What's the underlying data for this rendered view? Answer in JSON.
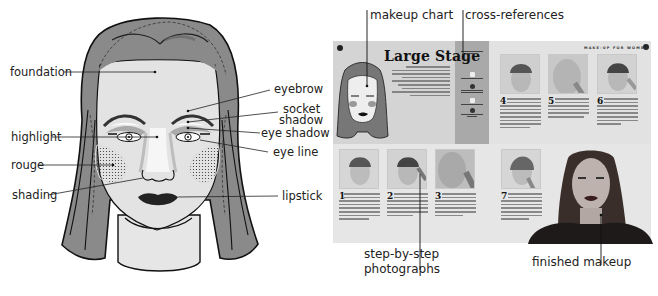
{
  "left_chart": {
    "labels_left": [
      {
        "id": "foundation",
        "text": "foundation"
      },
      {
        "id": "highlight",
        "text": "highlight"
      },
      {
        "id": "rouge",
        "text": "rouge"
      },
      {
        "id": "shading",
        "text": "shading"
      }
    ],
    "labels_right": [
      {
        "id": "eyebrow",
        "text": "eyebrow"
      },
      {
        "id": "socket_shadow_1",
        "text": "socket"
      },
      {
        "id": "socket_shadow_2",
        "text": "shadow"
      },
      {
        "id": "eye_shadow",
        "text": "eye shadow"
      },
      {
        "id": "eye_line",
        "text": "eye line"
      },
      {
        "id": "lipstick",
        "text": "lipstick"
      }
    ]
  },
  "spread": {
    "callouts": {
      "makeup_chart": "makeup chart",
      "cross_references": "cross-references",
      "step_photos_1": "step-by-step",
      "step_photos_2": "photographs",
      "finished": "finished makeup"
    },
    "page_title": "Large Stage",
    "running_head": "MAKE-UP FOR WOMEN",
    "steps": [
      "4",
      "5",
      "6",
      "1",
      "2",
      "3",
      "7"
    ]
  },
  "colors": {
    "hair": "#8a8a8a",
    "skin": "#e4e4e4",
    "left_page": "#d4d4d4",
    "sidebar": "#a9a9a9",
    "right_page": "#e2e2e2"
  }
}
